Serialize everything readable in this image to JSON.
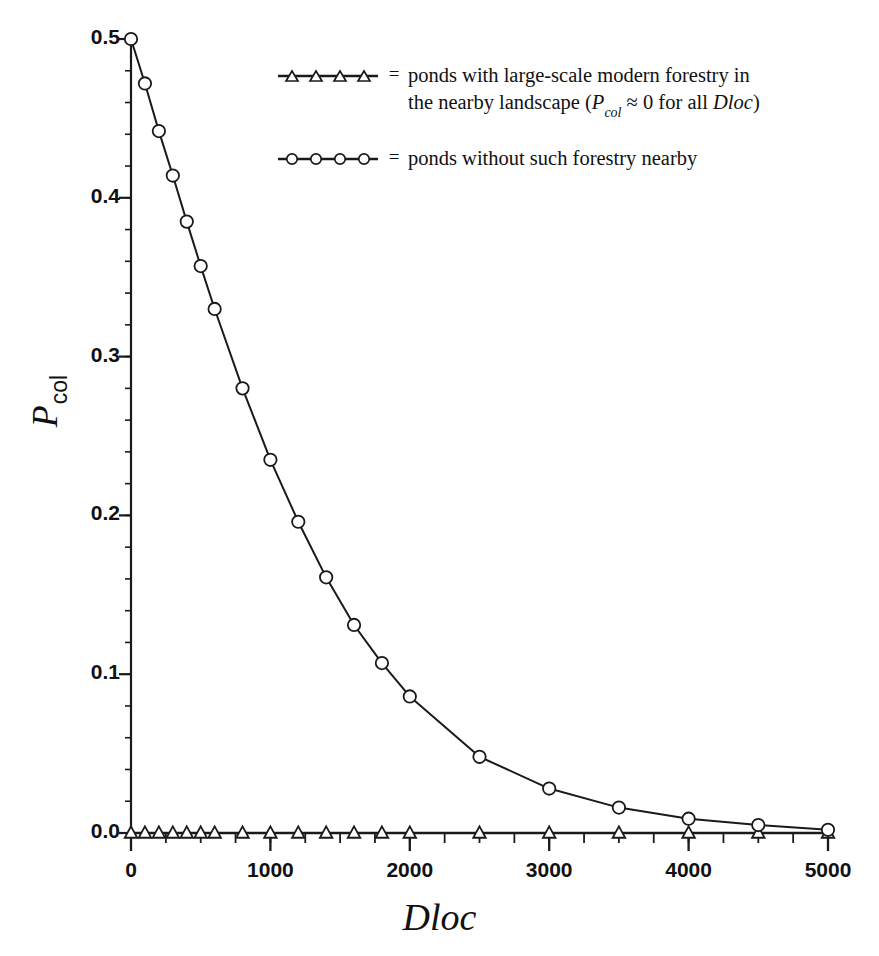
{
  "chart_data": {
    "type": "line",
    "title": "",
    "subtitle": "",
    "xlabel": "Dloc",
    "ylabel": "P_col",
    "ylabel_main": "P",
    "ylabel_sub": "col",
    "xlim": [
      0,
      5000
    ],
    "ylim": [
      0.0,
      0.5
    ],
    "grid": false,
    "legend_position": "top-center",
    "xticks": [
      0,
      1000,
      2000,
      3000,
      4000,
      5000
    ],
    "xtick_labels": [
      "0",
      "1000",
      "2000",
      "3000",
      "4000",
      "5000"
    ],
    "xminor_step": 250,
    "yticks": [
      0.0,
      0.1,
      0.2,
      0.3,
      0.4,
      0.5
    ],
    "ytick_labels": [
      "0.0",
      "0.1",
      "0.2",
      "0.3",
      "0.4",
      "0.5"
    ],
    "yminor_step": 0.02,
    "line_color": "#1a1a1a",
    "marker_edge_color": "#1a1a1a",
    "marker_face_color": "#ffffff",
    "background_color": "#ffffff",
    "x": [
      0,
      100,
      200,
      300,
      400,
      500,
      600,
      800,
      1000,
      1200,
      1400,
      1600,
      1800,
      2000,
      2500,
      3000,
      3500,
      4000,
      4500,
      5000
    ],
    "series": [
      {
        "name": "ponds without such forestry nearby",
        "marker": "circle",
        "values": [
          0.5,
          0.472,
          0.442,
          0.414,
          0.385,
          0.357,
          0.33,
          0.28,
          0.235,
          0.196,
          0.161,
          0.131,
          0.107,
          0.086,
          0.048,
          0.028,
          0.016,
          0.009,
          0.005,
          0.002
        ]
      },
      {
        "name": "ponds with large-scale modern forestry in the nearby landscape",
        "marker": "triangle",
        "values": [
          0.0,
          0.0,
          0.0,
          0.0,
          0.0,
          0.0,
          0.0,
          0.0,
          0.0,
          0.0,
          0.0,
          0.0,
          0.0,
          0.0,
          0.0,
          0.0,
          0.0,
          0.0,
          0.0,
          0.0
        ]
      }
    ]
  },
  "legend": {
    "rows": [
      {
        "marker": "triangle",
        "equals": "=",
        "line1_pre": "ponds with large-scale modern forestry in",
        "line2_pre": "the nearby landscape (",
        "line2_sym": "P",
        "line2_sub": "col",
        "line2_mid": " ≈ 0 for all ",
        "line2_var": "Dloc",
        "line2_post": ")"
      },
      {
        "marker": "circle",
        "equals": "=",
        "line1_pre": "ponds without such forestry nearby"
      }
    ]
  },
  "axis": {
    "x_title": "Dloc",
    "y_title_main": "P",
    "y_title_sub": "col"
  }
}
